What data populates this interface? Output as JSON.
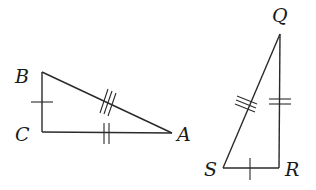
{
  "diagram": {
    "type": "congruent-triangles",
    "triangles": [
      {
        "name": "ABC",
        "vertices": {
          "B": {
            "label": "B",
            "x": 42,
            "y": 72
          },
          "C": {
            "label": "C",
            "x": 42,
            "y": 132
          },
          "A": {
            "label": "A",
            "x": 172,
            "y": 133
          }
        },
        "marks": {
          "BC": 1,
          "CA": 2,
          "AB": 3
        }
      },
      {
        "name": "QRS",
        "vertices": {
          "Q": {
            "label": "Q",
            "x": 280,
            "y": 34
          },
          "R": {
            "label": "R",
            "x": 279,
            "y": 168
          },
          "S": {
            "label": "S",
            "x": 223,
            "y": 168
          }
        },
        "marks": {
          "SR": 1,
          "QR": 2,
          "QS": 3
        }
      }
    ],
    "colors": {
      "stroke": "#2a2a2a",
      "text": "#1a1a1a",
      "background": "#ffffff"
    }
  },
  "labels": {
    "B": "B",
    "C": "C",
    "A": "A",
    "Q": "Q",
    "S": "S",
    "R": "R"
  }
}
